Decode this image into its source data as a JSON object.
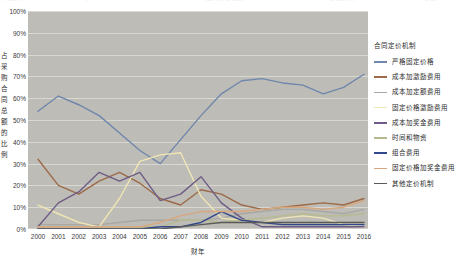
{
  "header_fragments": [
    "· ····  ·",
    "·",
    "···· · ·· ·· ·····",
    "·· ···· ·· ·",
    "·· ···"
  ],
  "legend": {
    "title": "合同定价机制"
  },
  "chart_data": {
    "type": "line",
    "title": "",
    "xlabel": "财年",
    "ylabel": "占采购合同总额的比例",
    "grid": true,
    "legend_position": "right",
    "plot_background": "#bdbcb6",
    "ylim": [
      0,
      100
    ],
    "yticks": [
      "0%",
      "10%",
      "20%",
      "30%",
      "40%",
      "50%",
      "60%",
      "70%",
      "80%",
      "90%",
      "100%"
    ],
    "ytick_values": [
      0,
      10,
      20,
      30,
      40,
      50,
      60,
      70,
      80,
      90,
      100
    ],
    "categories": [
      "2000",
      "2001",
      "2002",
      "2003",
      "2004",
      "2005",
      "2006",
      "2007",
      "2008",
      "2009",
      "2010",
      "2011",
      "2012",
      "2013",
      "2014",
      "2015",
      "2016"
    ],
    "series": [
      {
        "name": "严格固定价格",
        "color": "#7087ad",
        "values": [
          54,
          61,
          57,
          52,
          44,
          36,
          30,
          41,
          52,
          62,
          68,
          69,
          67,
          66,
          62,
          65,
          71
        ]
      },
      {
        "name": "成本加激励费用",
        "color": "#9c6a48",
        "values": [
          32,
          20,
          16,
          22,
          26,
          21,
          14,
          11,
          18,
          16,
          11,
          9,
          10,
          11,
          12,
          11,
          14
        ]
      },
      {
        "name": "成本加定额费用",
        "color": "#a8a8a4",
        "values": [
          2,
          2,
          2,
          2,
          3,
          4,
          4,
          4,
          4,
          5,
          7,
          8,
          9,
          9,
          8,
          7,
          9
        ]
      },
      {
        "name": "固定价格激励费用",
        "color": "#efe6b4",
        "values": [
          11,
          7,
          3,
          1,
          14,
          31,
          34,
          35,
          15,
          5,
          4,
          3,
          5,
          6,
          5,
          2,
          1
        ]
      },
      {
        "name": "成本加奖金费用",
        "color": "#6e5c86",
        "values": [
          1,
          12,
          17,
          26,
          22,
          26,
          13,
          16,
          24,
          12,
          5,
          1,
          1,
          1,
          1,
          1,
          1
        ]
      },
      {
        "name": "时间和物资",
        "color": "#b7b98e",
        "values": [
          1,
          1,
          1,
          1,
          1,
          1,
          1,
          4,
          4,
          3,
          4,
          5,
          6,
          7,
          6,
          6,
          7
        ]
      },
      {
        "name": "组合费用",
        "color": "#32488c",
        "values": [
          0,
          0,
          0,
          0,
          0,
          0,
          1,
          1,
          3,
          8,
          4,
          3,
          2,
          2,
          2,
          2,
          2
        ]
      },
      {
        "name": "固定价格加奖金费用",
        "color": "#d9a77e",
        "values": [
          1,
          1,
          1,
          1,
          1,
          1,
          3,
          6,
          8,
          8,
          8,
          9,
          10,
          10,
          9,
          10,
          13
        ]
      },
      {
        "name": "其他定价机制",
        "color": "#5a5a5a",
        "values": [
          0,
          0,
          0,
          0,
          0,
          0,
          0,
          1,
          2,
          3,
          3,
          3,
          3,
          3,
          3,
          3,
          3
        ]
      }
    ]
  }
}
